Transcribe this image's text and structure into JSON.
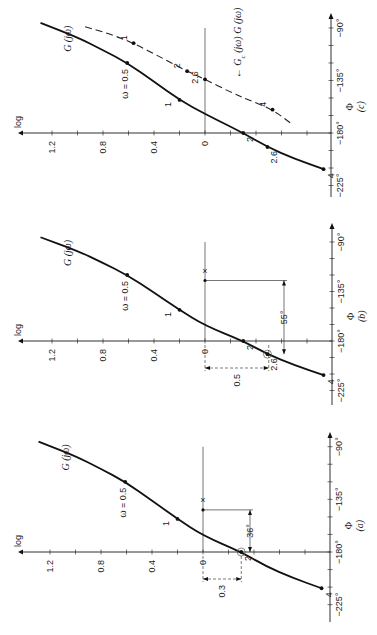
{
  "figure": {
    "orientation": "rotated 90 degrees counter-clockwise",
    "panels_order_top_to_bottom": [
      "c",
      "b",
      "a"
    ]
  },
  "chart_data": [
    {
      "type": "line",
      "panel_label": "(a)",
      "xlabel": "log",
      "ylabel": "Φ",
      "log_ticks": [
        "1.2",
        "0.8",
        "0.4",
        "0"
      ],
      "log_tick_values": [
        1.2,
        1.0,
        0.8,
        0.6,
        0.4,
        0.2,
        0.0,
        -0.2,
        -0.4,
        -0.6,
        -0.8,
        -1.0
      ],
      "phase_ticks": [
        "−90°",
        "−135°",
        "−180°",
        "−225°"
      ],
      "phase_tick_values": [
        -90,
        -105,
        -120,
        -135,
        -150,
        -165,
        -180,
        -195,
        -210,
        -225
      ],
      "layout": {
        "axisY": 552,
        "x0": 203,
        "sx": 127.5,
        "sy": 1.17,
        "axisX": 330,
        "logStart": 18,
        "phaseTop": 432,
        "phaseBottom": 622
      },
      "series": [
        {
          "name": "G (jω)",
          "style": "solid",
          "points": [
            [
              1.29,
              -85.7
            ],
            [
              1.0,
              -98
            ],
            [
              0.8,
              -109
            ],
            [
              0.61,
              -120
            ],
            [
              0.4,
              -136
            ],
            [
              0.2,
              -151.7
            ],
            [
              0.0,
              -166
            ],
            [
              -0.3,
              -180
            ],
            [
              -0.49,
              -192
            ],
            [
              -0.7,
              -202
            ],
            [
              -0.93,
              -211
            ]
          ],
          "markers": [
            {
              "omega": "ω = 0.5",
              "L": 0.61,
              "phi": -120
            },
            {
              "omega": "1",
              "L": 0.2,
              "phi": -151.7
            },
            {
              "omega": "2",
              "L": -0.3,
              "phi": -180,
              "circled": true
            },
            {
              "omega": "4",
              "L": -0.93,
              "phi": -211
            }
          ]
        }
      ],
      "annotations": {
        "crossing_label": "×",
        "phase_margin": "36°",
        "gain_margin": "0.3"
      }
    },
    {
      "type": "line",
      "panel_label": "(b)",
      "xlabel": "log",
      "ylabel": "Φ",
      "log_ticks": [
        "1.2",
        "0.8",
        "0.4",
        "0"
      ],
      "log_tick_values": [
        1.2,
        1.0,
        0.8,
        0.6,
        0.4,
        0.2,
        0.0,
        -0.2,
        -0.4,
        -0.6,
        -0.8,
        -1.0
      ],
      "phase_ticks": [
        "−90°",
        "−135°",
        "−180°",
        "−225°"
      ],
      "phase_tick_values": [
        -90,
        -105,
        -120,
        -135,
        -150,
        -165,
        -180,
        -195,
        -210,
        -225
      ],
      "layout": {
        "axisY": 341,
        "x0": 205,
        "sx": 127.5,
        "sy": 1.1,
        "axisX": 332,
        "logStart": 18,
        "phaseTop": 223,
        "phaseBottom": 405
      },
      "series": [
        {
          "name": "G (jω)",
          "style": "solid",
          "points": [
            [
              1.29,
              -85.7
            ],
            [
              1.0,
              -98
            ],
            [
              0.8,
              -109
            ],
            [
              0.61,
              -120
            ],
            [
              0.4,
              -136
            ],
            [
              0.2,
              -151.7
            ],
            [
              0.0,
              -166
            ],
            [
              -0.3,
              -180
            ],
            [
              -0.49,
              -192
            ],
            [
              -0.7,
              -202
            ],
            [
              -0.93,
              -211
            ]
          ],
          "markers": [
            {
              "omega": "ω = 0.5",
              "L": 0.61,
              "phi": -120
            },
            {
              "omega": "1",
              "L": 0.2,
              "phi": -151.7
            },
            {
              "omega": "2",
              "L": -0.3,
              "phi": -180
            },
            {
              "omega": "2.6",
              "L": -0.49,
              "phi": -192,
              "circled": true
            },
            {
              "omega": "4",
              "L": -0.93,
              "phi": -211
            }
          ]
        }
      ],
      "annotations": {
        "crossing_label": "×",
        "phase_margin": "55°",
        "gain_margin": "0.5"
      }
    },
    {
      "type": "line",
      "panel_label": "(c)",
      "xlabel": "log",
      "ylabel": "Φ",
      "log_ticks": [
        "1.2",
        "0.8",
        "0.4",
        "0"
      ],
      "log_tick_values": [
        1.2,
        1.0,
        0.8,
        0.6,
        0.4,
        0.2,
        0.0,
        -0.2,
        -0.4,
        -0.6,
        -0.8,
        -1.0
      ],
      "phase_ticks": [
        "−90°",
        "−135°",
        "−180°",
        "−225°"
      ],
      "phase_tick_values": [
        -90,
        -105,
        -120,
        -135,
        -150,
        -165,
        -180,
        -195,
        -210,
        -225
      ],
      "layout": {
        "axisY": 133,
        "x0": 205,
        "sx": 127.5,
        "sy": 1.167,
        "axisX": 331,
        "logStart": 18,
        "phaseTop": 13,
        "phaseBottom": 197
      },
      "series": [
        {
          "name": "G (jω)",
          "style": "solid",
          "points": [
            [
              1.29,
              -85.7
            ],
            [
              1.0,
              -98
            ],
            [
              0.8,
              -109
            ],
            [
              0.61,
              -120
            ],
            [
              0.4,
              -136
            ],
            [
              0.2,
              -151.7
            ],
            [
              0.0,
              -163.7
            ],
            [
              -0.3,
              -180
            ],
            [
              -0.49,
              -192
            ],
            [
              -0.7,
              -202
            ],
            [
              -0.93,
              -211
            ]
          ],
          "markers": [
            {
              "omega": "ω = 0.5",
              "L": 0.61,
              "phi": -120
            },
            {
              "omega": "1",
              "L": 0.2,
              "phi": -151.7
            },
            {
              "omega": "2",
              "L": -0.3,
              "phi": -180
            },
            {
              "omega": "2.6",
              "L": -0.49,
              "phi": -192
            },
            {
              "omega": "4",
              "L": -0.93,
              "phi": -211
            }
          ]
        },
        {
          "name": "G_c (jω) G (jω)",
          "style": "dashed",
          "points": [
            [
              0.94,
              -89
            ],
            [
              0.75,
              -95
            ],
            [
              0.56,
              -103
            ],
            [
              0.35,
              -115
            ],
            [
              0.14,
              -127
            ],
            [
              0.0,
              -134
            ],
            [
              -0.2,
              -145
            ],
            [
              -0.35,
              -152
            ],
            [
              -0.53,
              -160
            ],
            [
              -0.69,
              -173
            ]
          ],
          "markers": [
            {
              "omega": "1",
              "L": 0.56,
              "phi": -103
            },
            {
              "omega": "2",
              "L": 0.14,
              "phi": -127
            },
            {
              "omega": "2.6",
              "L": 0.0,
              "phi": -134
            },
            {
              "omega": "4",
              "L": -0.53,
              "phi": -160
            }
          ]
        }
      ],
      "annotations": {
        "compensated_label": "Gₙ"
      }
    }
  ],
  "labels": {
    "curve_name": "G (jω)",
    "compensated_name_prefix": "G",
    "compensated_name_sub": "c",
    "compensated_name_rest": " (jω) G (jω)",
    "log_axis": "log",
    "phase_axis": "Φ",
    "panel_a": "(a)",
    "panel_b": "(b)",
    "panel_c": "(c)",
    "pm_a": "36°",
    "pm_b": "55°",
    "gm_a": "0.3",
    "gm_b": "0.5",
    "cross": "×"
  }
}
